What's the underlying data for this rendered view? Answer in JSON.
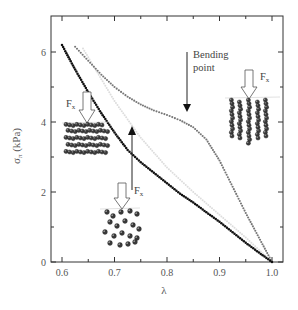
{
  "chart_data": {
    "type": "line",
    "title": "",
    "xlabel": "λ",
    "ylabel": "σ_π (kPa)",
    "xlim": [
      0.58,
      1.02
    ],
    "ylim": [
      0,
      7
    ],
    "x_ticks": [
      "0.6",
      "0.7",
      "0.8",
      "0.9",
      "1.0"
    ],
    "y_ticks": [
      "0",
      "2",
      "4",
      "6"
    ],
    "grid": false,
    "legend": null,
    "series": [
      {
        "name": "black dotted curve",
        "color": "#111111",
        "x": [
          0.6,
          0.625,
          0.65,
          0.675,
          0.7,
          0.725,
          0.75,
          0.775,
          0.8,
          0.825,
          0.85,
          0.875,
          0.9,
          0.925,
          0.95,
          0.975,
          1.0
        ],
        "y": [
          6.2,
          5.5,
          4.85,
          4.25,
          3.7,
          3.2,
          2.85,
          2.55,
          2.25,
          1.95,
          1.7,
          1.42,
          1.15,
          0.85,
          0.55,
          0.27,
          0.0
        ]
      },
      {
        "name": "gray dotted curve",
        "color": "#777777",
        "x": [
          0.625,
          0.65,
          0.675,
          0.7,
          0.725,
          0.75,
          0.775,
          0.8,
          0.825,
          0.85,
          0.875,
          0.9,
          0.925,
          0.95,
          0.975,
          1.0
        ],
        "y": [
          6.15,
          5.75,
          5.35,
          5.0,
          4.72,
          4.5,
          4.33,
          4.2,
          4.05,
          3.85,
          3.5,
          2.9,
          2.15,
          1.4,
          0.7,
          0.0
        ]
      },
      {
        "name": "faint gray curve",
        "color": "#dddddd",
        "x": [
          0.64,
          0.7,
          0.75,
          0.8,
          0.85,
          0.9,
          0.95,
          1.0
        ],
        "y": [
          6.1,
          4.6,
          3.55,
          2.7,
          2.0,
          1.35,
          0.7,
          0.0
        ]
      }
    ],
    "annotations": [
      {
        "text": "Bending",
        "text2": "point",
        "x": 0.835,
        "y": 4.1,
        "type": "arrow-down"
      },
      {
        "text": "F",
        "sub": "x",
        "x": 0.66,
        "y": 4.7,
        "type": "force-arrow",
        "inset": "aligned horizontal chains"
      },
      {
        "text": "F",
        "sub": "x",
        "x": 0.73,
        "y": 2.1,
        "type": "force-arrow",
        "inset": "random particles"
      },
      {
        "text": "F",
        "sub": "x",
        "x": 0.945,
        "y": 5.3,
        "type": "force-arrow",
        "inset": "aligned vertical chains"
      },
      {
        "text": "",
        "x": 0.73,
        "y": 3.25,
        "type": "arrow-up"
      }
    ]
  },
  "labels": {
    "xlabel": "λ",
    "ylabel_main": "σ",
    "ylabel_sub": "π",
    "ylabel_unit": " (kPa)",
    "bending_line1": "Bending",
    "bending_line2": "point",
    "force": "F",
    "force_sub": "x"
  }
}
